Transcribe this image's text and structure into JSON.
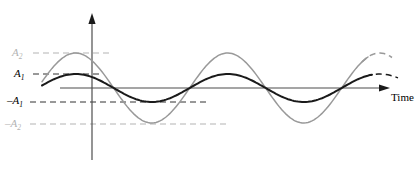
{
  "figure": {
    "type": "waveform-diagram",
    "background_color": "#ffffff"
  },
  "labels": {
    "amplitude_2": "A",
    "amplitude_2_sub": "2",
    "amplitude_1": "A",
    "amplitude_1_sub": "1",
    "neg_amplitude_1": "–A",
    "neg_amplitude_1_sub": "1",
    "neg_amplitude_2": "–A",
    "neg_amplitude_2_sub": "2",
    "time_axis": "Time"
  },
  "colors": {
    "curve_large": "#999999",
    "curve_small": "#1a1a1a",
    "axis": "#4d4d4d",
    "gridline_gray": "#b3b3b3",
    "gridline_black": "#333333",
    "label_gray": "#b3b3b3",
    "label_black": "#000000"
  },
  "chart_data": {
    "type": "line",
    "title": "",
    "xlabel": "Time",
    "ylabel": "",
    "grid": true,
    "legend_position": "none",
    "axis_origin_px": {
      "x": 92,
      "y": 88
    },
    "x_axis": {
      "start_px": 60,
      "end_px": 390,
      "arrow": true,
      "tick_labels": []
    },
    "y_axis": {
      "top_px": 15,
      "bottom_px": 160,
      "arrow": true,
      "tick_labels": [
        "A2",
        "A1",
        "-A1",
        "-A2"
      ],
      "tick_values": [
        35,
        14,
        -14,
        -35
      ],
      "tick_y_px": [
        53,
        74,
        102,
        124
      ]
    },
    "series": [
      {
        "name": "A2",
        "label": "A2",
        "color": "#999999",
        "amplitude": 35,
        "period_px": 152,
        "phase_offset_px": 16,
        "x_start_px": 42,
        "x_end_solid_px": 368,
        "x_end_dashed_px": 392,
        "peaks_px": [
          {
            "x": 110,
            "y": 53
          },
          {
            "x": 262,
            "y": 53
          }
        ],
        "troughs_px": [
          {
            "x": 186,
            "y": 124
          }
        ],
        "zero_crossings_px": [
          60,
          148,
          224,
          300,
          368
        ]
      },
      {
        "name": "A1",
        "label": "A1",
        "color": "#1a1a1a",
        "amplitude": 14,
        "period_px": 152,
        "phase_offset_px": 26,
        "x_start_px": 42,
        "x_end_solid_px": 372,
        "x_end_dashed_px": 398,
        "peaks_px": [
          {
            "x": 100,
            "y": 74
          },
          {
            "x": 252,
            "y": 74
          }
        ],
        "troughs_px": [
          {
            "x": 176,
            "y": 102
          }
        ],
        "zero_crossings_px": [
          52,
          138,
          214,
          290,
          366
        ]
      }
    ],
    "gridlines": [
      {
        "value_label": "A2",
        "y_px": 53,
        "x_from_px": 33,
        "x_to_px": 112,
        "color": "#b3b3b3",
        "dashed": true
      },
      {
        "value_label": "A1",
        "y_px": 74,
        "x_from_px": 33,
        "x_to_px": 101,
        "color": "#333333",
        "dashed": true
      },
      {
        "value_label": "-A1",
        "y_px": 102,
        "x_from_px": 30,
        "x_to_px": 208,
        "color": "#333333",
        "dashed": true
      },
      {
        "value_label": "-A2",
        "y_px": 124,
        "x_from_px": 30,
        "x_to_px": 228,
        "color": "#b3b3b3",
        "dashed": true
      }
    ],
    "annotations": [
      {
        "text": "Time",
        "x_px": 391,
        "y_px": 97
      }
    ]
  }
}
